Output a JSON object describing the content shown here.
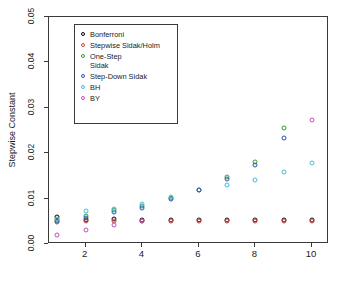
{
  "chart_data": {
    "type": "scatter",
    "title": "",
    "xlabel": "",
    "ylabel": "Stepwise Constant",
    "x": [
      1,
      2,
      3,
      4,
      5,
      6,
      7,
      8,
      9,
      10
    ],
    "xlim": [
      0.7,
      10.6
    ],
    "ylim": [
      0.0,
      0.05
    ],
    "xticks": [
      2,
      4,
      6,
      8,
      10
    ],
    "xticklabels": [
      "2",
      "4",
      "6",
      "8",
      "10"
    ],
    "yticks": [
      0.0,
      0.01,
      0.02,
      0.03,
      0.04,
      0.05
    ],
    "yticklabels": [
      "0.00",
      "0.01",
      "0.02",
      "0.03",
      "0.04",
      "0.05"
    ],
    "grid": false,
    "legend_position": "upper left",
    "series": [
      {
        "name": "Bonferroni",
        "color": "#000000",
        "values": [
          0.05,
          0.025,
          0.0167,
          0.0125,
          0.01,
          0.0083,
          0.0071,
          0.0062,
          0.0056,
          0.005
        ]
      },
      {
        "name": "Stepwise Sidak/Holm",
        "color": "#d04040",
        "values": [
          0.05,
          0.0253,
          0.017,
          0.0127,
          0.0102,
          0.0085,
          0.0073,
          0.0064,
          0.0057,
          0.0051
        ]
      },
      {
        "name": "One-Step\nSidak",
        "color": "#2f9f2f",
        "values": [
          0.05,
          0.0253,
          0.017,
          0.0127,
          0.0102,
          0.0085,
          0.0073,
          0.0064,
          0.0057,
          0.0051
        ]
      },
      {
        "name": "Step-Down Sidak",
        "color": "#3050c0",
        "values": [
          0.05,
          0.0253,
          0.017,
          0.0127,
          0.0102,
          0.0085,
          0.0073,
          0.0064,
          0.0057,
          0.0051
        ]
      },
      {
        "name": "BH",
        "color": "#40c0d0",
        "values": [
          0.05,
          0.025,
          0.0167,
          0.0125,
          0.01,
          0.0083,
          0.0071,
          0.0062,
          0.0056,
          0.005
        ]
      },
      {
        "name": "BY",
        "color": "#c050c0",
        "values": [
          0.05,
          0.0333,
          0.0273,
          0.024,
          0.0219,
          0.0204,
          0.0193,
          0.0184,
          0.0177,
          0.0171
        ]
      }
    ],
    "points": [
      {
        "x": 1,
        "y": 0.006,
        "color": "#000000"
      },
      {
        "x": 1,
        "y": 0.0048,
        "color": "#d04040"
      },
      {
        "x": 1,
        "y": 0.0052,
        "color": "#2f9f2f"
      },
      {
        "x": 1,
        "y": 0.005,
        "color": "#3050c0"
      },
      {
        "x": 1,
        "y": 0.0056,
        "color": "#40c0d0"
      },
      {
        "x": 1,
        "y": 0.002,
        "color": "#c050c0"
      },
      {
        "x": 2,
        "y": 0.0052,
        "color": "#000000"
      },
      {
        "x": 2,
        "y": 0.005,
        "color": "#d04040"
      },
      {
        "x": 2,
        "y": 0.0062,
        "color": "#2f9f2f"
      },
      {
        "x": 2,
        "y": 0.0058,
        "color": "#3050c0"
      },
      {
        "x": 2,
        "y": 0.0072,
        "color": "#40c0d0"
      },
      {
        "x": 2,
        "y": 0.003,
        "color": "#c050c0"
      },
      {
        "x": 3,
        "y": 0.0054,
        "color": "#000000"
      },
      {
        "x": 3,
        "y": 0.005,
        "color": "#d04040"
      },
      {
        "x": 3,
        "y": 0.0074,
        "color": "#2f9f2f"
      },
      {
        "x": 3,
        "y": 0.007,
        "color": "#3050c0"
      },
      {
        "x": 3,
        "y": 0.0078,
        "color": "#40c0d0"
      },
      {
        "x": 3,
        "y": 0.0042,
        "color": "#c050c0"
      },
      {
        "x": 4,
        "y": 0.0052,
        "color": "#000000"
      },
      {
        "x": 4,
        "y": 0.005,
        "color": "#d04040"
      },
      {
        "x": 4,
        "y": 0.0084,
        "color": "#2f9f2f"
      },
      {
        "x": 4,
        "y": 0.008,
        "color": "#3050c0"
      },
      {
        "x": 4,
        "y": 0.0088,
        "color": "#40c0d0"
      },
      {
        "x": 4,
        "y": 0.005,
        "color": "#c050c0"
      },
      {
        "x": 5,
        "y": 0.0052,
        "color": "#000000"
      },
      {
        "x": 5,
        "y": 0.005,
        "color": "#d04040"
      },
      {
        "x": 5,
        "y": 0.0102,
        "color": "#2f9f2f"
      },
      {
        "x": 5,
        "y": 0.01,
        "color": "#3050c0"
      },
      {
        "x": 5,
        "y": 0.0104,
        "color": "#40c0d0"
      },
      {
        "x": 6,
        "y": 0.0052,
        "color": "#000000"
      },
      {
        "x": 6,
        "y": 0.005,
        "color": "#d04040"
      },
      {
        "x": 6,
        "y": 0.012,
        "color": "#2f9f2f"
      },
      {
        "x": 6,
        "y": 0.0118,
        "color": "#3050c0"
      },
      {
        "x": 7,
        "y": 0.0052,
        "color": "#000000"
      },
      {
        "x": 7,
        "y": 0.005,
        "color": "#d04040"
      },
      {
        "x": 7,
        "y": 0.0148,
        "color": "#2f9f2f"
      },
      {
        "x": 7,
        "y": 0.0143,
        "color": "#3050c0"
      },
      {
        "x": 7,
        "y": 0.0129,
        "color": "#40c0d0"
      },
      {
        "x": 8,
        "y": 0.0052,
        "color": "#000000"
      },
      {
        "x": 8,
        "y": 0.005,
        "color": "#d04040"
      },
      {
        "x": 8,
        "y": 0.018,
        "color": "#2f9f2f"
      },
      {
        "x": 8,
        "y": 0.0175,
        "color": "#3050c0"
      },
      {
        "x": 8,
        "y": 0.0141,
        "color": "#40c0d0"
      },
      {
        "x": 9,
        "y": 0.0052,
        "color": "#000000"
      },
      {
        "x": 9,
        "y": 0.005,
        "color": "#d04040"
      },
      {
        "x": 9,
        "y": 0.0255,
        "color": "#2f9f2f"
      },
      {
        "x": 9,
        "y": 0.0234,
        "color": "#3050c0"
      },
      {
        "x": 9,
        "y": 0.0158,
        "color": "#40c0d0"
      },
      {
        "x": 10,
        "y": 0.0052,
        "color": "#000000"
      },
      {
        "x": 10,
        "y": 0.005,
        "color": "#d04040"
      },
      {
        "x": 10,
        "y": 0.0178,
        "color": "#40c0d0"
      },
      {
        "x": 10,
        "y": 0.0274,
        "color": "#c050c0"
      }
    ]
  },
  "legend": {
    "entries": [
      {
        "label": "Bonferroni",
        "color": "#000000"
      },
      {
        "label": "Stepwise Sidak/Holm",
        "color": "#d04040"
      },
      {
        "label": "One-Step\nSidak",
        "color": "#2f9f2f"
      },
      {
        "label": "Step-Down Sidak",
        "color": "#3050c0"
      },
      {
        "label": "BH",
        "color": "#40c0d0"
      },
      {
        "label": "BY",
        "color": "#c050c0"
      }
    ]
  },
  "axes": {
    "y_title": "Stepwise Constant",
    "y_ticklabels": [
      "0.00",
      "0.01",
      "0.02",
      "0.03",
      "0.04",
      "0.05"
    ],
    "x_ticklabels": [
      "2",
      "4",
      "6",
      "8",
      "10"
    ]
  }
}
